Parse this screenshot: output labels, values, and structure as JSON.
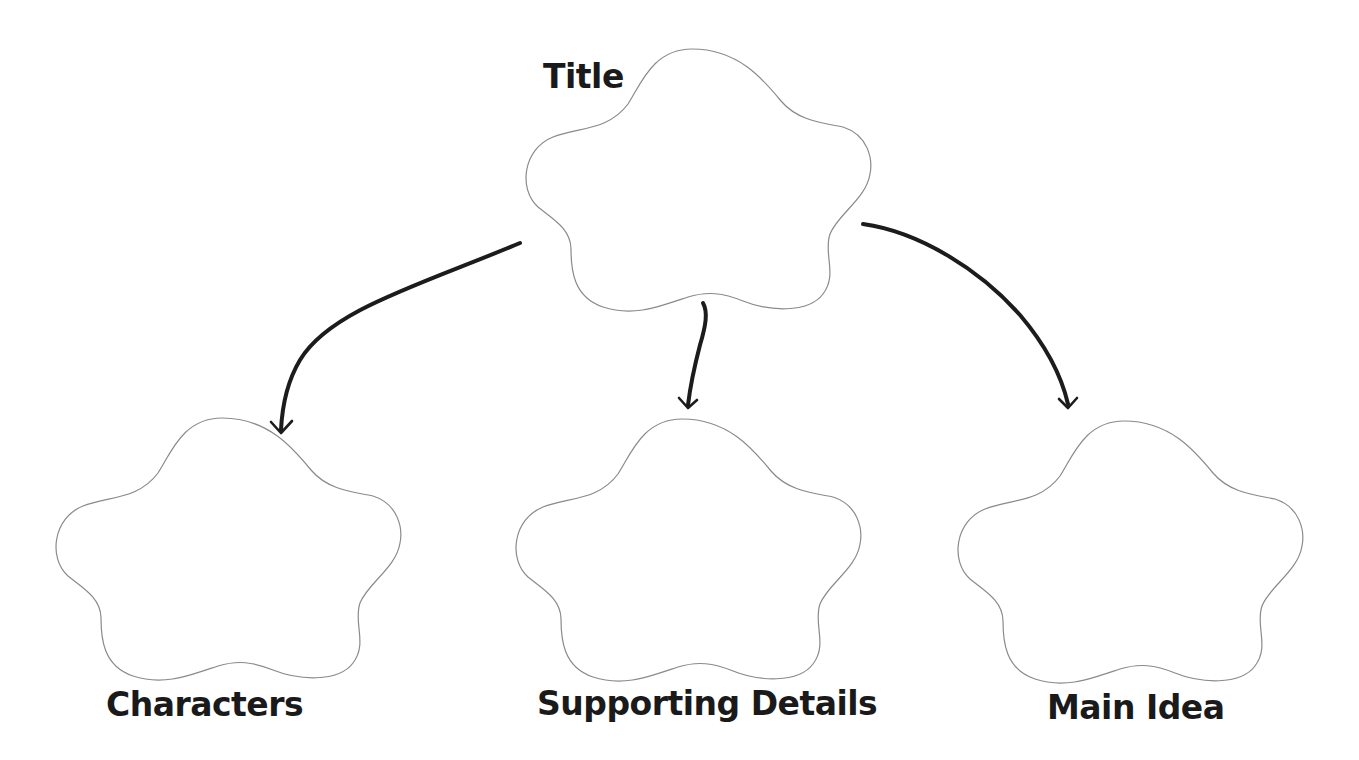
{
  "diagram": {
    "type": "graphic-organizer",
    "colors": {
      "background": "#ffffff",
      "outline": "#8a8a8a",
      "arrow": "#1c1c1c",
      "text": "#1a1a1a"
    },
    "nodes": [
      {
        "id": "title",
        "label": "Title",
        "shape": "flower",
        "x": 523,
        "y": 49,
        "label_x": 543,
        "label_y": 60,
        "font_size": 33
      },
      {
        "id": "characters",
        "label": "Characters",
        "shape": "flower",
        "x": 53,
        "y": 418,
        "label_x": 106,
        "label_y": 688,
        "font_size": 33
      },
      {
        "id": "supporting-details",
        "label": "Supporting Details",
        "shape": "flower",
        "x": 513,
        "y": 419,
        "label_x": 537,
        "label_y": 687,
        "font_size": 33
      },
      {
        "id": "main-idea",
        "label": "Main Idea",
        "shape": "flower",
        "x": 955,
        "y": 421,
        "label_x": 1047,
        "label_y": 691,
        "font_size": 33
      }
    ],
    "edges": [
      {
        "from": "title",
        "to": "characters",
        "start": [
          520,
          243
        ],
        "end": [
          281,
          432
        ]
      },
      {
        "from": "title",
        "to": "supporting-details",
        "start": [
          703,
          303
        ],
        "end": [
          688,
          407
        ]
      },
      {
        "from": "title",
        "to": "main-idea",
        "start": [
          863,
          224
        ],
        "end": [
          1068,
          407
        ]
      }
    ]
  }
}
